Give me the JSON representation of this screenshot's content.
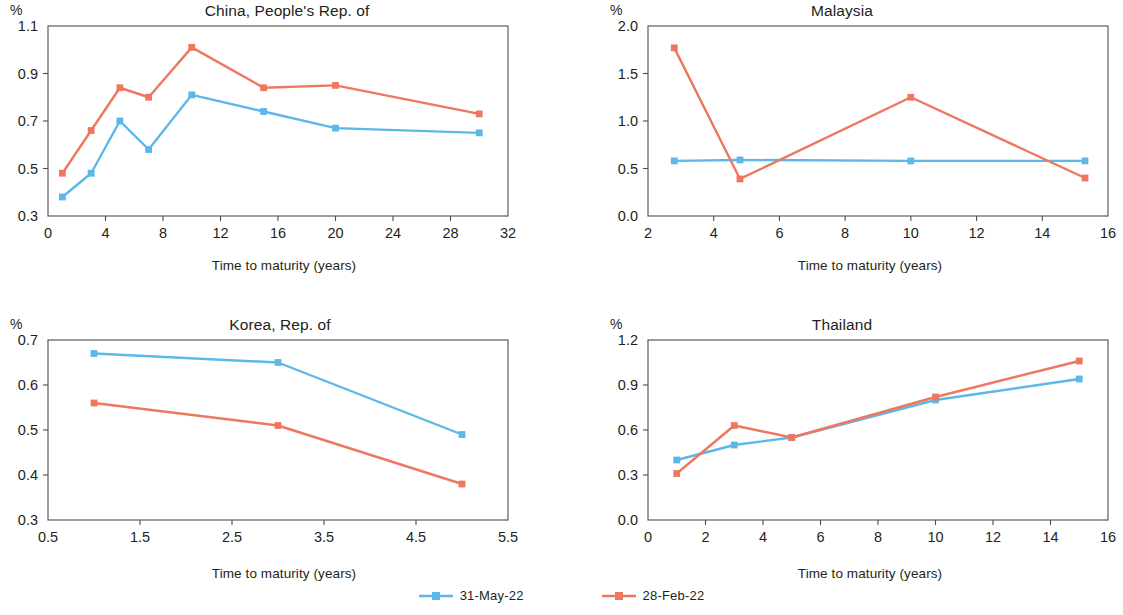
{
  "legend": {
    "items": [
      {
        "label": "31-May-22",
        "color": "#5BB8E8",
        "marker": "square"
      },
      {
        "label": "28-Feb-22",
        "color": "#EE7760",
        "marker": "square"
      }
    ]
  },
  "colors": {
    "series_may": "#5BB8E8",
    "series_feb": "#EE7760",
    "axis": "#4d4d4d",
    "text": "#231f20"
  },
  "common": {
    "unit_label": "%",
    "xlabel": "Time to maturity (years)"
  },
  "chart_data": [
    {
      "type": "line",
      "title": "China, People's Rep. of",
      "xlabel": "Time to maturity (years)",
      "ylabel": "%",
      "xlim": [
        0,
        32
      ],
      "ylim": [
        0.3,
        1.1
      ],
      "xticks": [
        0,
        4,
        8,
        12,
        16,
        20,
        24,
        28,
        32
      ],
      "yticks": [
        0.3,
        0.5,
        0.7,
        0.9,
        1.1
      ],
      "grid": false,
      "legend_position": "bottom-figure",
      "series": [
        {
          "name": "31-May-22",
          "color": "#5BB8E8",
          "x": [
            1,
            3,
            5,
            7,
            10,
            15,
            20,
            30
          ],
          "values": [
            0.38,
            0.48,
            0.7,
            0.58,
            0.81,
            0.74,
            0.67,
            0.65
          ]
        },
        {
          "name": "28-Feb-22",
          "color": "#EE7760",
          "x": [
            1,
            3,
            5,
            7,
            10,
            15,
            20,
            30
          ],
          "values": [
            0.48,
            0.66,
            0.84,
            0.8,
            1.01,
            0.84,
            0.85,
            0.73
          ]
        }
      ]
    },
    {
      "type": "line",
      "title": "Malaysia",
      "xlabel": "Time to maturity (years)",
      "ylabel": "%",
      "xlim": [
        2,
        16
      ],
      "ylim": [
        0.0,
        2.0
      ],
      "xticks": [
        2,
        4,
        6,
        8,
        10,
        12,
        14,
        16
      ],
      "yticks": [
        0.0,
        0.5,
        1.0,
        1.5,
        2.0
      ],
      "grid": false,
      "legend_position": "bottom-figure",
      "series": [
        {
          "name": "31-May-22",
          "color": "#5BB8E8",
          "x": [
            2.8,
            4.8,
            10,
            15.3
          ],
          "values": [
            0.58,
            0.59,
            0.58,
            0.58
          ]
        },
        {
          "name": "28-Feb-22",
          "color": "#EE7760",
          "x": [
            2.8,
            4.8,
            10,
            15.3
          ],
          "values": [
            1.77,
            0.39,
            1.25,
            0.4
          ]
        }
      ]
    },
    {
      "type": "line",
      "title": "Korea, Rep. of",
      "xlabel": "Time to maturity (years)",
      "ylabel": "%",
      "xlim": [
        0.5,
        5.5
      ],
      "ylim": [
        0.3,
        0.7
      ],
      "xticks": [
        0.5,
        1.5,
        2.5,
        3.5,
        4.5,
        5.5
      ],
      "yticks": [
        0.3,
        0.4,
        0.5,
        0.6,
        0.7
      ],
      "grid": false,
      "legend_position": "bottom-figure",
      "series": [
        {
          "name": "31-May-22",
          "color": "#5BB8E8",
          "x": [
            1.0,
            3.0,
            5.0
          ],
          "values": [
            0.67,
            0.65,
            0.49
          ]
        },
        {
          "name": "28-Feb-22",
          "color": "#EE7760",
          "x": [
            1.0,
            3.0,
            5.0
          ],
          "values": [
            0.56,
            0.51,
            0.38
          ]
        }
      ]
    },
    {
      "type": "line",
      "title": "Thailand",
      "xlabel": "Time to maturity (years)",
      "ylabel": "%",
      "xlim": [
        0,
        16
      ],
      "ylim": [
        0.0,
        1.2
      ],
      "xticks": [
        0,
        2,
        4,
        6,
        8,
        10,
        12,
        14,
        16
      ],
      "yticks": [
        0.0,
        0.3,
        0.6,
        0.9,
        1.2
      ],
      "grid": false,
      "legend_position": "bottom-figure",
      "series": [
        {
          "name": "31-May-22",
          "color": "#5BB8E8",
          "x": [
            1,
            3,
            5,
            10,
            15
          ],
          "values": [
            0.4,
            0.5,
            0.55,
            0.8,
            0.94
          ]
        },
        {
          "name": "28-Feb-22",
          "color": "#EE7760",
          "x": [
            1,
            3,
            5,
            10,
            15
          ],
          "values": [
            0.31,
            0.63,
            0.55,
            0.82,
            1.06
          ]
        }
      ]
    }
  ]
}
